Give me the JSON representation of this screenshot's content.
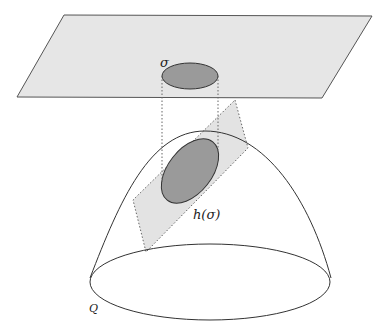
{
  "diagram": {
    "labels": {
      "sigma": "σ",
      "h_sigma": "h(σ)",
      "Q": "Q"
    },
    "colors": {
      "background": "#ffffff",
      "plane_fill": "#e6e6e6",
      "plane_stroke": "#555555",
      "region_fill": "#9a9a9a",
      "region_stroke": "#333333",
      "patch_fill": "#e3e3e3",
      "dotted_stroke": "#666666",
      "dome_stroke": "#333333"
    },
    "shapes": {
      "plane": {
        "type": "parallelogram",
        "points": [
          [
            64,
            15
          ],
          [
            372,
            16
          ],
          [
            322,
            98
          ],
          [
            17,
            97
          ]
        ]
      },
      "sigma_region": {
        "type": "ellipse",
        "cx": 190,
        "cy": 76,
        "rx": 28,
        "ry": 13
      },
      "projection_lines": {
        "type": "dotted",
        "x": [
          162,
          218
        ],
        "from_y": 76,
        "to_y": 180
      },
      "tilted_patch": {
        "type": "dotted-parallelogram",
        "points": [
          [
            235,
            100
          ],
          [
            248,
            148
          ],
          [
            146,
            252
          ],
          [
            133,
            200
          ]
        ]
      },
      "h_sigma_region": {
        "type": "ellipse",
        "cx": 190,
        "cy": 171,
        "rx": 22,
        "ry": 37,
        "rotate": 38
      },
      "dome": {
        "type": "dome",
        "apex": [
          205,
          131
        ],
        "base_left": [
          90,
          278
        ],
        "base_right": [
          331,
          278
        ]
      },
      "base_ellipse": {
        "type": "ellipse",
        "cx": 210,
        "cy": 282,
        "rx": 120,
        "ry": 38
      }
    }
  }
}
